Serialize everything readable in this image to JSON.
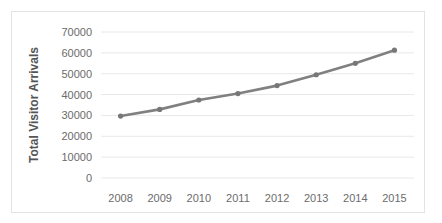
{
  "chart_data": {
    "type": "line",
    "title": "",
    "xlabel": "",
    "ylabel": "Total Visitor Arrivals",
    "categories": [
      "2008",
      "2009",
      "2010",
      "2011",
      "2012",
      "2013",
      "2014",
      "2015"
    ],
    "values": [
      29700,
      32900,
      37400,
      40500,
      44300,
      49500,
      55000,
      61300
    ],
    "series": [
      {
        "name": "Total Visitor Arrivals",
        "values": [
          29700,
          32900,
          37400,
          40500,
          44300,
          49500,
          55000,
          61300
        ]
      }
    ],
    "ylim": [
      0,
      70000
    ],
    "yticks": [
      0,
      10000,
      20000,
      30000,
      40000,
      50000,
      60000,
      70000
    ],
    "ytick_labels": [
      "0",
      "10000",
      "20000",
      "30000",
      "40000",
      "50000",
      "60000",
      "70000"
    ],
    "xtick_labels": [
      "2008",
      "2009",
      "2010",
      "2011",
      "2012",
      "2013",
      "2014",
      "2015"
    ],
    "grid": "horizontal",
    "legend": "none",
    "markers": "circle",
    "colors": {
      "line": "#808080",
      "marker": "#777777",
      "gridline": "#e8e8e8",
      "tick_text": "#6b6b6b",
      "axis_title": "#555555",
      "border": "#e3e3e3",
      "background": "#ffffff"
    }
  }
}
